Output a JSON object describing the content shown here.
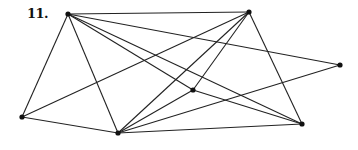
{
  "problem_label": "11.",
  "graph": {
    "node_color": "#111111",
    "edge_color": "#222222",
    "nodes": [
      {
        "id": "A",
        "x": 68,
        "y": 14
      },
      {
        "id": "B",
        "x": 249,
        "y": 12
      },
      {
        "id": "R",
        "x": 340,
        "y": 65
      },
      {
        "id": "C",
        "x": 193,
        "y": 90
      },
      {
        "id": "L",
        "x": 22,
        "y": 117
      },
      {
        "id": "Bt",
        "x": 118,
        "y": 133
      },
      {
        "id": "BR",
        "x": 302,
        "y": 124
      }
    ],
    "edges": [
      [
        "A",
        "B"
      ],
      [
        "A",
        "R"
      ],
      [
        "A",
        "C"
      ],
      [
        "A",
        "BR"
      ],
      [
        "A",
        "Bt"
      ],
      [
        "A",
        "L"
      ],
      [
        "B",
        "L"
      ],
      [
        "B",
        "Bt"
      ],
      [
        "B",
        "C"
      ],
      [
        "B",
        "BR"
      ],
      [
        "L",
        "Bt"
      ],
      [
        "Bt",
        "C"
      ],
      [
        "Bt",
        "R"
      ],
      [
        "Bt",
        "BR"
      ],
      [
        "C",
        "BR"
      ]
    ]
  }
}
